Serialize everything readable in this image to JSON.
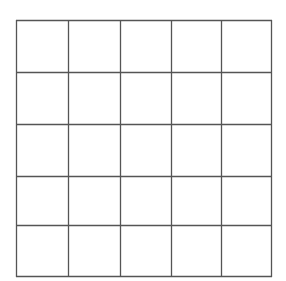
{
  "grid": {
    "rows": 5,
    "cols": 5,
    "x_lines": [
      16,
      68,
      120,
      171,
      221,
      271
    ],
    "y_lines": [
      20,
      72,
      124,
      176,
      225,
      276
    ],
    "line_color": "#555555",
    "background": "#ffffff",
    "cells": [
      [
        "",
        "",
        "",
        "",
        ""
      ],
      [
        "",
        "",
        "",
        "",
        ""
      ],
      [
        "",
        "",
        "",
        "",
        ""
      ],
      [
        "",
        "",
        "",
        "",
        ""
      ],
      [
        "",
        "",
        "",
        "",
        ""
      ]
    ]
  }
}
